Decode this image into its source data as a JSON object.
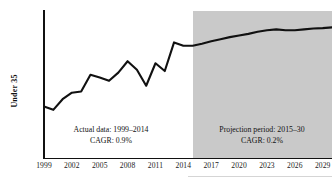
{
  "chart_data": {
    "type": "line",
    "title": "",
    "xlabel": "",
    "ylabel": "Under 35",
    "ylim": [
      4400,
      6200
    ],
    "ytick_step": 200,
    "xlim": [
      1999,
      2030
    ],
    "grid": false,
    "legend": null,
    "ytick_labels": [
      "6,200",
      "6,000",
      "5,800",
      "5,600",
      "5,400",
      "5,200",
      "5,000",
      "4,800",
      "4,600",
      "4,400"
    ],
    "ytick_values": [
      6200,
      6000,
      5800,
      5600,
      5400,
      5200,
      5000,
      4800,
      4600,
      4400
    ],
    "xtick_labels": [
      "1999",
      "2002",
      "2005",
      "2008",
      "2011",
      "2014",
      "2017",
      "2020",
      "2023",
      "2026",
      "2029"
    ],
    "xtick_values": [
      1999,
      2002,
      2005,
      2008,
      2011,
      2014,
      2017,
      2020,
      2023,
      2026,
      2029
    ],
    "x": [
      1999,
      2000,
      2001,
      2002,
      2003,
      2004,
      2005,
      2006,
      2007,
      2008,
      2009,
      2010,
      2011,
      2012,
      2013,
      2014,
      2015,
      2016,
      2017,
      2018,
      2019,
      2020,
      2021,
      2022,
      2023,
      2024,
      2025,
      2026,
      2027,
      2028,
      2029,
      2030
    ],
    "values": [
      5030,
      4990,
      5120,
      5200,
      5215,
      5420,
      5385,
      5345,
      5445,
      5585,
      5480,
      5285,
      5560,
      5465,
      5815,
      5775,
      5775,
      5800,
      5830,
      5855,
      5880,
      5900,
      5920,
      5945,
      5965,
      5975,
      5965,
      5965,
      5975,
      5985,
      5990,
      6000
    ],
    "series": [
      {
        "name": "Under 35 population",
        "color": "#111111",
        "values": [
          5030,
          4990,
          5120,
          5200,
          5215,
          5420,
          5385,
          5345,
          5445,
          5585,
          5480,
          5285,
          5560,
          5465,
          5815,
          5775,
          5775,
          5800,
          5830,
          5855,
          5880,
          5900,
          5920,
          5945,
          5965,
          5975,
          5965,
          5965,
          5975,
          5985,
          5990,
          6000
        ]
      }
    ],
    "regions": [
      {
        "name": "actual",
        "start": 1999,
        "end": 2014,
        "shaded": false,
        "shade_color": "#ffffff"
      },
      {
        "name": "projection",
        "start": 2015,
        "end": 2030,
        "shaded": true,
        "shade_color": "#c9c9c9"
      }
    ],
    "annotations": [
      {
        "id": "actual",
        "line1": "Actual data: 1999–2014",
        "line2": "CAGR: 0.9%"
      },
      {
        "id": "projection",
        "line1": "Projection period: 2015–30",
        "line2": "CAGR: 0.2%"
      }
    ]
  },
  "axis": {
    "y_title": "Under 35"
  }
}
